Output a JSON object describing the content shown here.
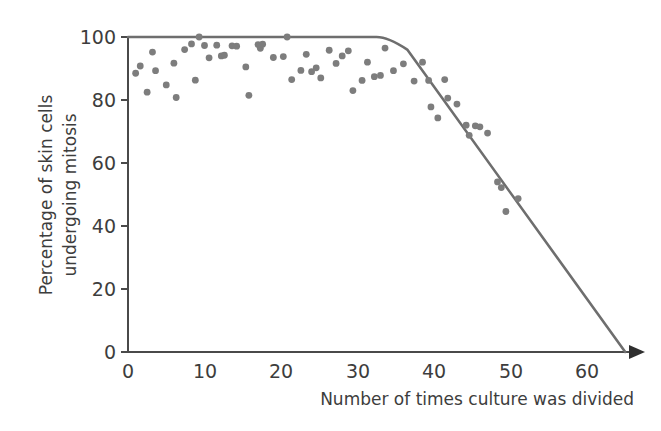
{
  "figure": {
    "background_color": "#ffffff",
    "point_color": "#7d7d7d",
    "line_color": "#6e6e6e",
    "axis_color": "#4a4a4a",
    "text_color": "#3d3d3d"
  },
  "chart_data": {
    "type": "scatter",
    "title": "",
    "xlabel": "Number of times culture was divided",
    "ylabel_line1": "Percentage of skin cells",
    "ylabel_line2": "undergoing mitosis",
    "xlim": [
      0,
      65
    ],
    "ylim": [
      0,
      103
    ],
    "grid": false,
    "legend": null,
    "xticks": [
      0,
      10,
      20,
      30,
      40,
      50,
      60
    ],
    "xtick_labels": [
      "0",
      "10",
      "20",
      "30",
      "40",
      "50",
      "60"
    ],
    "yticks": [
      0,
      20,
      40,
      60,
      80,
      100
    ],
    "ytick_labels": [
      "0",
      "20",
      "40",
      "60",
      "80",
      "100"
    ],
    "x_axis_has_arrow": true,
    "series": [
      {
        "name": "Observed cultures",
        "marker": "circle",
        "color": "#7d7d7d",
        "points": [
          [
            1.0,
            88.5
          ],
          [
            1.6,
            90.8
          ],
          [
            2.5,
            82.5
          ],
          [
            3.2,
            95.2
          ],
          [
            3.6,
            89.3
          ],
          [
            5.0,
            84.8
          ],
          [
            6.0,
            91.7
          ],
          [
            6.3,
            80.8
          ],
          [
            7.4,
            96.0
          ],
          [
            8.3,
            97.8
          ],
          [
            8.8,
            86.3
          ],
          [
            9.3,
            100.0
          ],
          [
            10.0,
            97.3
          ],
          [
            10.6,
            93.4
          ],
          [
            11.6,
            97.4
          ],
          [
            12.2,
            94.0
          ],
          [
            12.6,
            94.2
          ],
          [
            13.6,
            97.2
          ],
          [
            14.2,
            97.1
          ],
          [
            15.4,
            90.5
          ],
          [
            15.8,
            81.5
          ],
          [
            17.0,
            97.6
          ],
          [
            17.3,
            96.4
          ],
          [
            17.6,
            97.7
          ],
          [
            19.0,
            93.5
          ],
          [
            20.3,
            93.8
          ],
          [
            20.8,
            100.0
          ],
          [
            21.4,
            86.5
          ],
          [
            22.6,
            89.4
          ],
          [
            23.3,
            94.5
          ],
          [
            24.0,
            89.0
          ],
          [
            24.6,
            90.2
          ],
          [
            25.2,
            87.0
          ],
          [
            26.3,
            95.8
          ],
          [
            27.2,
            91.6
          ],
          [
            28.0,
            94.0
          ],
          [
            28.8,
            95.6
          ],
          [
            29.4,
            83.0
          ],
          [
            30.6,
            86.2
          ],
          [
            31.3,
            92.0
          ],
          [
            32.2,
            87.4
          ],
          [
            33.0,
            87.8
          ],
          [
            33.6,
            96.5
          ],
          [
            34.7,
            89.3
          ],
          [
            36.0,
            91.5
          ],
          [
            37.4,
            86.0
          ],
          [
            38.5,
            92.0
          ],
          [
            39.3,
            86.2
          ],
          [
            39.6,
            77.8
          ],
          [
            40.5,
            74.3
          ],
          [
            41.4,
            86.5
          ],
          [
            41.8,
            80.6
          ],
          [
            43.0,
            78.7
          ],
          [
            44.2,
            72.0
          ],
          [
            44.6,
            68.8
          ],
          [
            45.4,
            71.8
          ],
          [
            46.0,
            71.5
          ],
          [
            47.0,
            69.5
          ],
          [
            48.3,
            54.0
          ],
          [
            48.8,
            52.2
          ],
          [
            49.4,
            44.6
          ],
          [
            51.0,
            48.7
          ]
        ]
      }
    ],
    "trend_line": {
      "name": "Fitted decline curve",
      "color": "#6e6e6e",
      "description": "Plateau at 100% through ~34 divisions, then linear decline reaching 0% at ~65 divisions",
      "vertices": [
        [
          0,
          100
        ],
        [
          32.5,
          100
        ],
        [
          36.5,
          96
        ],
        [
          65,
          0
        ]
      ],
      "plateau_value": 100,
      "plateau_end_x": 34,
      "zero_crossing_x": 65
    }
  }
}
